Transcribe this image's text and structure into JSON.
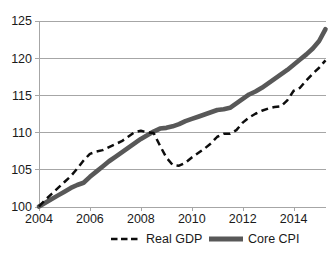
{
  "chart_data": {
    "type": "line",
    "title": "",
    "xlabel": "",
    "ylabel": "",
    "xlim": [
      2004,
      2015.25
    ],
    "ylim": [
      100,
      125
    ],
    "grid": true,
    "legend_position": "bottom",
    "xticks": [
      "2004",
      "2006",
      "2008",
      "2010",
      "2012",
      "2014"
    ],
    "xtick_values": [
      2004,
      2006,
      2008,
      2010,
      2012,
      2014
    ],
    "yticks": [
      "100",
      "105",
      "110",
      "115",
      "120",
      "125"
    ],
    "ytick_values": [
      100,
      105,
      110,
      115,
      120,
      125
    ],
    "series": [
      {
        "name": "Real GDP",
        "style": "dashed",
        "color": "#0d0d0d",
        "x": [
          2004.0,
          2004.25,
          2004.5,
          2004.75,
          2005.0,
          2005.25,
          2005.5,
          2005.75,
          2006.0,
          2006.25,
          2006.5,
          2006.75,
          2007.0,
          2007.25,
          2007.5,
          2007.75,
          2008.0,
          2008.25,
          2008.5,
          2008.75,
          2009.0,
          2009.25,
          2009.5,
          2009.75,
          2010.0,
          2010.25,
          2010.5,
          2010.75,
          2011.0,
          2011.25,
          2011.5,
          2011.75,
          2012.0,
          2012.25,
          2012.5,
          2012.75,
          2013.0,
          2013.25,
          2013.5,
          2013.75,
          2014.0,
          2014.25,
          2014.5,
          2014.75,
          2015.0,
          2015.25
        ],
        "y": [
          100.0,
          100.9,
          101.7,
          102.5,
          103.3,
          104.1,
          105.1,
          106.2,
          107.1,
          107.4,
          107.6,
          108.0,
          108.4,
          108.8,
          109.4,
          110.0,
          110.2,
          110.0,
          109.9,
          108.2,
          106.6,
          105.6,
          105.5,
          105.9,
          106.6,
          107.2,
          107.8,
          108.5,
          109.4,
          109.8,
          109.8,
          110.3,
          111.3,
          112.0,
          112.5,
          112.9,
          113.2,
          113.4,
          113.5,
          114.3,
          115.6,
          116.0,
          117.0,
          117.9,
          118.7,
          119.7
        ]
      },
      {
        "name": "Core CPI",
        "style": "solid-thick",
        "color": "#585858",
        "x": [
          2004.0,
          2004.25,
          2004.5,
          2004.75,
          2005.0,
          2005.25,
          2005.5,
          2005.75,
          2006.0,
          2006.25,
          2006.5,
          2006.75,
          2007.0,
          2007.25,
          2007.5,
          2007.75,
          2008.0,
          2008.25,
          2008.5,
          2008.75,
          2009.0,
          2009.25,
          2009.5,
          2009.75,
          2010.0,
          2010.25,
          2010.5,
          2010.75,
          2011.0,
          2011.25,
          2011.5,
          2011.75,
          2012.0,
          2012.25,
          2012.5,
          2012.75,
          2013.0,
          2013.25,
          2013.5,
          2013.75,
          2014.0,
          2014.25,
          2014.5,
          2014.75,
          2015.0,
          2015.25
        ],
        "y": [
          100.0,
          100.5,
          101.0,
          101.5,
          102.0,
          102.5,
          102.9,
          103.2,
          104.0,
          104.7,
          105.4,
          106.1,
          106.7,
          107.3,
          107.9,
          108.5,
          109.1,
          109.6,
          110.1,
          110.5,
          110.6,
          110.8,
          111.1,
          111.5,
          111.8,
          112.1,
          112.4,
          112.7,
          113.0,
          113.1,
          113.3,
          113.9,
          114.5,
          115.1,
          115.5,
          116.0,
          116.6,
          117.2,
          117.8,
          118.4,
          119.1,
          119.8,
          120.5,
          121.3,
          122.3,
          123.9
        ]
      }
    ],
    "legend": [
      {
        "label": "Real GDP",
        "style": "dashed",
        "color": "#0d0d0d"
      },
      {
        "label": "Core CPI",
        "style": "solid-thick",
        "color": "#585858"
      }
    ]
  },
  "colors": {
    "gdp": "#0d0d0d",
    "cpi": "#585858",
    "grid": "#a6a6a6",
    "background": "#ffffff"
  },
  "footer": {
    "text": ""
  }
}
